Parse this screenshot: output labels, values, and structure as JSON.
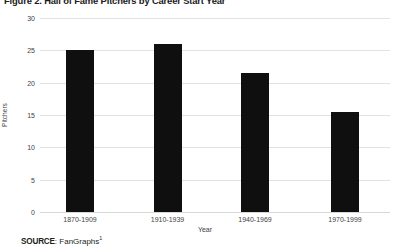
{
  "figure": {
    "title": "Figure 2. Hall of Fame Pitchers by Career Start Year",
    "source_label": "SOURCE",
    "source_separator": ": ",
    "source_value": "FanGraphs",
    "source_footnote": "1"
  },
  "chart_data": {
    "type": "bar",
    "title": "Figure 2. Hall of Fame Pitchers by Career Start Year",
    "xlabel": "Year",
    "ylabel": "Pitchers",
    "categories": [
      "1870-1909",
      "1910-1939",
      "1940-1969",
      "1970-1999"
    ],
    "values": [
      25,
      26,
      21.5,
      15.4
    ],
    "series": [
      {
        "name": "Pitchers",
        "values": [
          25,
          26,
          21.5,
          15.4
        ],
        "color": "#100f0f"
      }
    ],
    "ylim": [
      0,
      30
    ],
    "ytick_values": [
      30,
      25,
      20,
      15,
      10,
      5,
      0
    ],
    "ytick_labels": [
      "30",
      "25",
      "20",
      "15",
      "10",
      "5",
      "0"
    ],
    "grid": "horizontal",
    "grid_color": "#e2e2e2",
    "legend": "none",
    "bar_color": "#100f0f",
    "background": "#ffffff"
  }
}
